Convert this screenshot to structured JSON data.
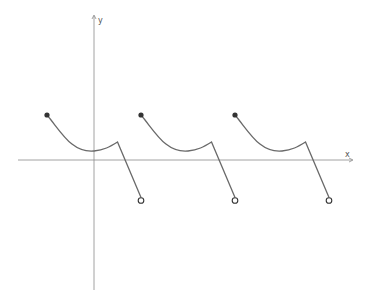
{
  "graph": {
    "x_label": "x",
    "y_label": "y",
    "description": "Periodic piecewise function: each period starts at a closed point, decreases along a curve to a minimum, rises slightly to a corner, then drops linearly to an open endpoint below the x-axis",
    "periods": 3,
    "closed_point_style": "filled",
    "open_point_style": "hollow",
    "colors": {
      "axis": "#8a8a8a",
      "curve": "#6a6a6a",
      "point": "#333333"
    }
  },
  "chart_data": {
    "type": "line",
    "title": "",
    "xlabel": "x",
    "ylabel": "y",
    "grid": false,
    "period": 1,
    "segment_template": {
      "start_closed": [
        -0.5,
        0.5
      ],
      "min": [
        0,
        0.1
      ],
      "corner": [
        0.25,
        0.2
      ],
      "end_open": [
        0.5,
        -0.45
      ]
    },
    "series": [
      {
        "name": "period-1",
        "x_offset": 0
      },
      {
        "name": "period-2",
        "x_offset": 1
      },
      {
        "name": "period-3",
        "x_offset": 2
      }
    ]
  }
}
